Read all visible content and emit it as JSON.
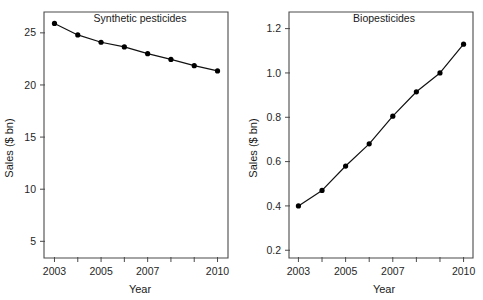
{
  "figure": {
    "panels": [
      {
        "title": "Synthetic pesticides",
        "xlabel": "Year",
        "ylabel": "Sales ($ bn)"
      },
      {
        "title": "Biopesticides",
        "xlabel": "Year",
        "ylabel": "Sales ($ bn)"
      }
    ]
  },
  "chart_data": [
    {
      "type": "line",
      "title": "Synthetic pesticides",
      "xlabel": "Year",
      "ylabel": "Sales ($ bn)",
      "x": [
        2003,
        2004,
        2005,
        2006,
        2007,
        2008,
        2009,
        2010
      ],
      "values": [
        25.9,
        24.8,
        24.1,
        23.65,
        23.0,
        22.45,
        21.85,
        21.35
      ],
      "xtick_values": [
        2003,
        2004,
        2005,
        2006,
        2007,
        2008,
        2009,
        2010
      ],
      "xtick_labels": [
        "2003",
        "",
        "2005",
        "",
        "2007",
        "",
        "",
        "2010"
      ],
      "ytick_values": [
        5,
        10,
        15,
        20,
        25
      ],
      "ytick_labels": [
        "5",
        "10",
        "15",
        "20",
        "25"
      ],
      "xlim": [
        2002.55,
        2010.45
      ],
      "ylim": [
        3.4,
        27.0
      ],
      "grid": false,
      "legend": "none",
      "marker": "filled-circle",
      "line_color": "#111111"
    },
    {
      "type": "line",
      "title": "Biopesticides",
      "xlabel": "Year",
      "ylabel": "Sales ($ bn)",
      "x": [
        2003,
        2004,
        2005,
        2006,
        2007,
        2008,
        2009,
        2010
      ],
      "values": [
        0.4,
        0.47,
        0.58,
        0.68,
        0.805,
        0.915,
        1.0,
        1.13
      ],
      "xtick_values": [
        2003,
        2004,
        2005,
        2006,
        2007,
        2008,
        2009,
        2010
      ],
      "xtick_labels": [
        "2003",
        "",
        "2005",
        "",
        "2007",
        "",
        "",
        "2010"
      ],
      "ytick_values": [
        0.2,
        0.4,
        0.6,
        0.8,
        1.0,
        1.2
      ],
      "ytick_labels": [
        "0.2",
        "0.4",
        "0.6",
        "0.8",
        "1.0",
        "1.2"
      ],
      "xlim": [
        2002.6,
        2010.4
      ],
      "ylim": [
        0.165,
        1.275
      ],
      "grid": false,
      "legend": "none",
      "marker": "filled-circle",
      "line_color": "#111111"
    }
  ]
}
